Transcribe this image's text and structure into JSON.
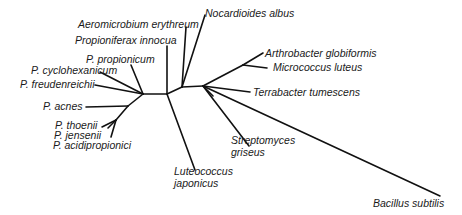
{
  "diagram": {
    "type": "unrooted phylogenetic tree",
    "line_color": "#111111",
    "text_color": "#1a1a1a",
    "taxa": {
      "nocardioides": "Nocardioides albus",
      "aeromicrobium": "Aeromicrobium erythreum",
      "propioniferax": "Propioniferax innocua",
      "p_propionicum": "P. propionicum",
      "p_cyclohexanicum": "P. cyclohexanicum",
      "p_freudenreichii": "P. freudenreichii",
      "p_acnes": "P. acnes",
      "p_thoenii": "P. thoenii",
      "p_jensenii": "P. jensenii",
      "p_acidipropionici": "P. acidipropionici",
      "luteococcus_1": "Luteococcus",
      "luteococcus_2": "japonicus",
      "arthrobacter": "Arthrobacter globiformis",
      "micrococcus": "Micrococcus luteus",
      "terrabacter": "Terrabacter tumescens",
      "streptomyces_1": "Streptomyces",
      "streptomyces_2": "griseus",
      "bacillus": "Bacillus subtilis"
    }
  }
}
